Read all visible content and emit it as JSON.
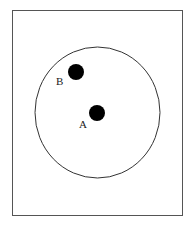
{
  "diagram": {
    "frame": {
      "x": 12,
      "y": 10,
      "width": 170,
      "height": 205,
      "stroke": "#555555"
    },
    "circle": {
      "cx": 97.5,
      "cy": 112.5,
      "rx": 62.5,
      "ry": 65.5,
      "stroke": "#333333"
    },
    "points": [
      {
        "id": "A",
        "label": "A",
        "cx": 97,
        "cy": 113,
        "r": 8,
        "fill": "#000000",
        "label_x": 79,
        "label_y": 119
      },
      {
        "id": "B",
        "label": "B",
        "cx": 76,
        "cy": 72,
        "r": 8,
        "fill": "#000000",
        "label_x": 56,
        "label_y": 76
      }
    ]
  }
}
